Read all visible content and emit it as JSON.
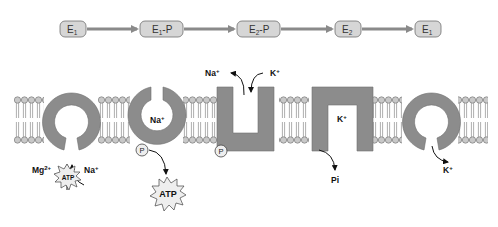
{
  "colors": {
    "protein": "#8c8c8c",
    "box_fill": "#d6d6d6",
    "box_stroke": "#707070",
    "flow_arrow": "#8a8a8a",
    "lipid_head": "#c8c8c8",
    "lipid_stroke": "#6a6a6a"
  },
  "cycle": {
    "states": [
      {
        "label": "E",
        "sub": "1",
        "suffix": ""
      },
      {
        "label": "E",
        "sub": "1",
        "suffix": "-P"
      },
      {
        "label": "E",
        "sub": "2",
        "suffix": "-P"
      },
      {
        "label": "E",
        "sub": "2",
        "suffix": ""
      },
      {
        "label": "E",
        "sub": "1",
        "suffix": ""
      }
    ]
  },
  "stages": [
    {
      "id": "stage-1",
      "shape": "ring-open-bottom",
      "labels": {
        "left": "Mg",
        "left_sup": "2+",
        "right": "Na",
        "right_sup": "+",
        "atp": "ATP"
      }
    },
    {
      "id": "stage-2",
      "shape": "ring-open-top",
      "labels": {
        "inside": "Na",
        "inside_sup": "+",
        "phosphate": "P",
        "released": "ATP"
      }
    },
    {
      "id": "stage-3",
      "shape": "u-open-top",
      "labels": {
        "out": "Na",
        "out_sup": "+",
        "in": "K",
        "in_sup": "+",
        "phosphate": "P"
      }
    },
    {
      "id": "stage-4",
      "shape": "u-open-bottom",
      "labels": {
        "inside": "K",
        "inside_sup": "+",
        "released": "Pi"
      }
    },
    {
      "id": "stage-5",
      "shape": "ring-open-bottom",
      "labels": {
        "released": "K",
        "released_sup": "+"
      }
    }
  ]
}
